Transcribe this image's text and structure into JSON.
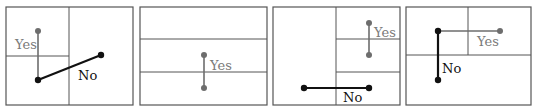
{
  "labels": {
    "yes": "Yes",
    "no": "No"
  },
  "colors": {
    "yes": "#6d6d6d",
    "no": "#111111",
    "grid": "#555555"
  },
  "panels": [
    {
      "id": 1,
      "yes_label": "Yes",
      "no_label": "No"
    },
    {
      "id": 2,
      "yes_label": "Yes"
    },
    {
      "id": 3,
      "yes_label": "Yes",
      "no_label": "No"
    },
    {
      "id": 4,
      "yes_label": "Yes",
      "no_label": "No"
    }
  ]
}
